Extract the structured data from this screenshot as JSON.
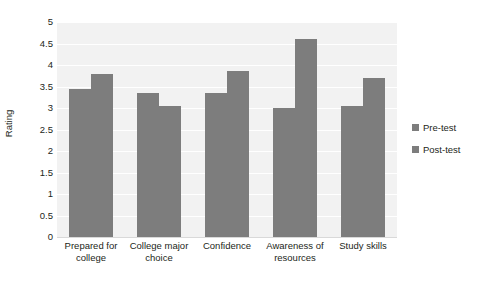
{
  "chart_data": {
    "type": "bar",
    "title": "",
    "xlabel": "",
    "ylabel": "Rating",
    "ylim": [
      0,
      5
    ],
    "ytick_step": 0.5,
    "yticks": [
      "5",
      "4.5",
      "4",
      "3.5",
      "3",
      "2.5",
      "2",
      "1.5",
      "1",
      "0.5",
      "0"
    ],
    "grid": true,
    "legend_position": "right",
    "categories": [
      "Prepared for college",
      "College major choice",
      "Confidence",
      "Awareness of resources",
      "Study skills"
    ],
    "series": [
      {
        "name": "Pre-test",
        "values": [
          3.45,
          3.35,
          3.35,
          3.0,
          3.05
        ],
        "color": "#7d7d7d"
      },
      {
        "name": "Post-test",
        "values": [
          3.8,
          3.05,
          3.85,
          4.6,
          3.7
        ],
        "color": "#7d7d7d"
      }
    ]
  },
  "legend": {
    "items": [
      {
        "label": "Pre-test",
        "swatch": "#7d7d7d"
      },
      {
        "label": "Post-test",
        "swatch": "#7d7d7d"
      }
    ]
  },
  "colors": {
    "bar": "#7d7d7d",
    "plot_background": "#f2f2f2",
    "gridline": "#ffffff",
    "text": "#231f20",
    "page_background": "#ffffff"
  }
}
